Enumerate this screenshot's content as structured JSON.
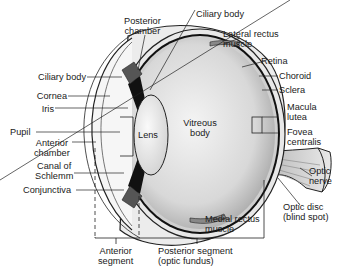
{
  "diagram": {
    "labels": {
      "posterior_chamber_1": "Posterior",
      "posterior_chamber_2": "chamber",
      "ciliary_body_top": "Ciliary body",
      "lateral_rectus_1": "Lateral rectus",
      "lateral_rectus_2": "muscle",
      "retina": "Retina",
      "choroid": "Choroid",
      "sclera": "Sclera",
      "macula_1": "Macula",
      "macula_2": "lutea",
      "fovea_1": "Fovea",
      "fovea_2": "centralis",
      "optic_nerve_1": "Optic",
      "optic_nerve_2": "nerve",
      "optic_disc_1": "Optic disc",
      "optic_disc_2": "(blind spot)",
      "medial_rectus_1": "Medial rectus",
      "medial_rectus_2": "muscle",
      "posterior_segment_1": "Posterior segment",
      "posterior_segment_2": "(optic fundus)",
      "anterior_segment_1": "Anterior",
      "anterior_segment_2": "segment",
      "ciliary_body_left": "Ciliary body",
      "cornea": "Cornea",
      "iris": "Iris",
      "pupil": "Pupil",
      "anterior_chamber_1": "Anterior",
      "anterior_chamber_2": "chamber",
      "canal_1": "Canal of",
      "canal_2": "Schlemm",
      "conjunctiva": "Conjunctiva",
      "lens": "Lens",
      "vitreous_1": "Vitreous",
      "vitreous_2": "body"
    }
  }
}
